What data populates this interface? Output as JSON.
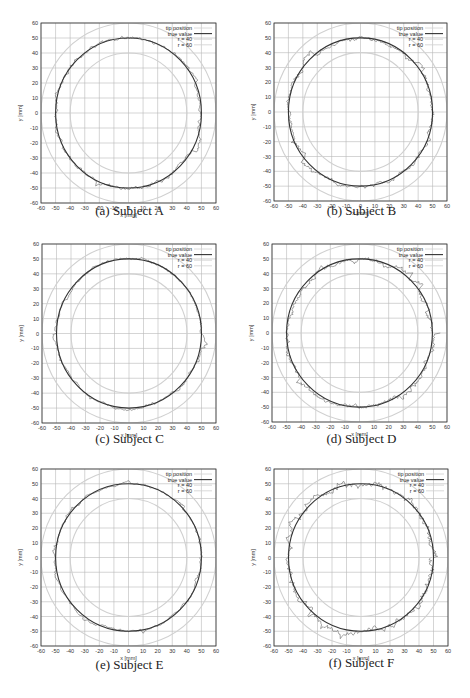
{
  "figure": {
    "panels": [
      {
        "id": "a",
        "caption": "(a) Subject A",
        "frame": {
          "x": 41,
          "y": 23,
          "w": 175,
          "h": 180
        },
        "caption_y": 213,
        "noise": 1.6,
        "seed": 11
      },
      {
        "id": "b",
        "caption": "(b) Subject B",
        "frame": {
          "x": 274,
          "y": 23,
          "w": 173,
          "h": 178
        },
        "caption_y": 213,
        "noise": 1.8,
        "seed": 23
      },
      {
        "id": "c",
        "caption": "(c) Subject C",
        "frame": {
          "x": 42,
          "y": 244,
          "w": 174,
          "h": 179
        },
        "caption_y": 441,
        "noise": 1.2,
        "seed": 37
      },
      {
        "id": "d",
        "caption": "(d) Subject D",
        "frame": {
          "x": 272,
          "y": 244,
          "w": 175,
          "h": 178
        },
        "caption_y": 441,
        "noise": 2.0,
        "seed": 51
      },
      {
        "id": "e",
        "caption": "(e) Subject E",
        "frame": {
          "x": 41,
          "y": 469,
          "w": 175,
          "h": 177
        },
        "caption_y": 667,
        "noise": 1.0,
        "seed": 67
      },
      {
        "id": "f",
        "caption": "(f) Subject F",
        "frame": {
          "x": 274,
          "y": 469,
          "w": 174,
          "h": 177
        },
        "caption_y": 665,
        "noise": 2.8,
        "seed": 79
      }
    ]
  },
  "chart_data": [
    {
      "type": "line",
      "title": "(a) Subject A",
      "xlabel": "x [mm]",
      "ylabel": "y [mm]",
      "xlim": [
        -60,
        60
      ],
      "ylim": [
        -60,
        60
      ],
      "xticks": [
        -60,
        -50,
        -40,
        -30,
        -20,
        -10,
        0,
        10,
        20,
        30,
        40,
        50,
        60
      ],
      "yticks": [
        -60,
        -50,
        -40,
        -30,
        -20,
        -10,
        0,
        10,
        20,
        30,
        40,
        50,
        60
      ],
      "grid": true,
      "legend_position": "upper right",
      "series": [
        {
          "name": "tip position",
          "description": "noisy trace around r=50 circle, max deviation ~5 mm"
        },
        {
          "name": "true value",
          "shape": "circle",
          "radius": 50,
          "center": [
            0,
            0
          ]
        },
        {
          "name": "r = 40",
          "shape": "circle",
          "radius": 40,
          "center": [
            0,
            0
          ]
        },
        {
          "name": "r = 60",
          "shape": "circle",
          "radius": 60,
          "center": [
            0,
            0
          ]
        }
      ]
    },
    {
      "type": "line",
      "title": "(b) Subject B",
      "xlabel": "x [mm]",
      "ylabel": "y [mm]",
      "xlim": [
        -60,
        60
      ],
      "ylim": [
        -60,
        60
      ],
      "xticks": [
        -60,
        -50,
        -40,
        -30,
        -20,
        -10,
        0,
        10,
        20,
        30,
        40,
        50,
        60
      ],
      "yticks": [
        -60,
        -50,
        -40,
        -30,
        -20,
        -10,
        0,
        10,
        20,
        30,
        40,
        50,
        60
      ],
      "grid": true,
      "legend_position": "upper right",
      "series": [
        {
          "name": "tip position",
          "description": "noisy trace around r=50 circle, max deviation ~6 mm"
        },
        {
          "name": "true value",
          "shape": "circle",
          "radius": 50,
          "center": [
            0,
            0
          ]
        },
        {
          "name": "r = 40",
          "shape": "circle",
          "radius": 40,
          "center": [
            0,
            0
          ]
        },
        {
          "name": "r = 60",
          "shape": "circle",
          "radius": 60,
          "center": [
            0,
            0
          ]
        }
      ]
    },
    {
      "type": "line",
      "title": "(c) Subject C",
      "xlabel": "x [mm]",
      "ylabel": "y [mm]",
      "xlim": [
        -60,
        60
      ],
      "ylim": [
        -60,
        60
      ],
      "xticks": [
        -60,
        -50,
        -40,
        -30,
        -20,
        -10,
        0,
        10,
        20,
        30,
        40,
        50,
        60
      ],
      "yticks": [
        -60,
        -50,
        -40,
        -30,
        -20,
        -10,
        0,
        10,
        20,
        30,
        40,
        50,
        60
      ],
      "grid": true,
      "legend_position": "upper right",
      "series": [
        {
          "name": "tip position",
          "description": "noisy trace around r=50 circle, max deviation ~5 mm"
        },
        {
          "name": "true value",
          "shape": "circle",
          "radius": 50,
          "center": [
            0,
            0
          ]
        },
        {
          "name": "r = 40",
          "shape": "circle",
          "radius": 40,
          "center": [
            0,
            0
          ]
        },
        {
          "name": "r = 60",
          "shape": "circle",
          "radius": 60,
          "center": [
            0,
            0
          ]
        }
      ]
    },
    {
      "type": "line",
      "title": "(d) Subject D",
      "xlabel": "x [mm]",
      "ylabel": "y [mm]",
      "xlim": [
        -60,
        60
      ],
      "ylim": [
        -60,
        60
      ],
      "xticks": [
        -60,
        -50,
        -40,
        -30,
        -20,
        -10,
        0,
        10,
        20,
        30,
        40,
        50,
        60
      ],
      "yticks": [
        -60,
        -50,
        -40,
        -30,
        -20,
        -10,
        0,
        10,
        20,
        30,
        40,
        50,
        60
      ],
      "grid": true,
      "legend_position": "upper right",
      "series": [
        {
          "name": "tip position",
          "description": "noisy trace around r=50 circle, max deviation ~7 mm"
        },
        {
          "name": "true value",
          "shape": "circle",
          "radius": 50,
          "center": [
            0,
            0
          ]
        },
        {
          "name": "r = 40",
          "shape": "circle",
          "radius": 40,
          "center": [
            0,
            0
          ]
        },
        {
          "name": "r = 60",
          "shape": "circle",
          "radius": 60,
          "center": [
            0,
            0
          ]
        }
      ]
    },
    {
      "type": "line",
      "title": "(e) Subject E",
      "xlabel": "x [mm]",
      "ylabel": "y [mm]",
      "xlim": [
        -60,
        60
      ],
      "ylim": [
        -60,
        60
      ],
      "xticks": [
        -60,
        -50,
        -40,
        -30,
        -20,
        -10,
        0,
        10,
        20,
        30,
        40,
        50,
        60
      ],
      "yticks": [
        -60,
        -50,
        -40,
        -30,
        -20,
        -10,
        0,
        10,
        20,
        30,
        40,
        50,
        60
      ],
      "grid": true,
      "legend_position": "upper right",
      "series": [
        {
          "name": "tip position",
          "description": "noisy trace around r=50 circle, max deviation ~4 mm"
        },
        {
          "name": "true value",
          "shape": "circle",
          "radius": 50,
          "center": [
            0,
            0
          ]
        },
        {
          "name": "r = 40",
          "shape": "circle",
          "radius": 40,
          "center": [
            0,
            0
          ]
        },
        {
          "name": "r = 60",
          "shape": "circle",
          "radius": 60,
          "center": [
            0,
            0
          ]
        }
      ]
    },
    {
      "type": "line",
      "title": "(f) Subject F",
      "xlabel": "x [mm]",
      "ylabel": "y [mm]",
      "xlim": [
        -60,
        60
      ],
      "ylim": [
        -60,
        60
      ],
      "xticks": [
        -60,
        -50,
        -40,
        -30,
        -20,
        -10,
        0,
        10,
        20,
        30,
        40,
        50,
        60
      ],
      "yticks": [
        -60,
        -50,
        -40,
        -30,
        -20,
        -10,
        0,
        10,
        20,
        30,
        40,
        50,
        60
      ],
      "grid": true,
      "legend_position": "upper right",
      "series": [
        {
          "name": "tip position",
          "description": "noisy trace around r=50 circle, max deviation ~10 mm"
        },
        {
          "name": "true value",
          "shape": "circle",
          "radius": 50,
          "center": [
            0,
            0
          ]
        },
        {
          "name": "r = 40",
          "shape": "circle",
          "radius": 40,
          "center": [
            0,
            0
          ]
        },
        {
          "name": "r = 60",
          "shape": "circle",
          "radius": 60,
          "center": [
            0,
            0
          ]
        }
      ]
    }
  ],
  "style": {
    "grid_color": "#b8b8b8",
    "frame_color": "#333333",
    "true_value_color": "#333333",
    "tip_color": "#555555",
    "ref_circle_color": "#d0d0d0"
  }
}
